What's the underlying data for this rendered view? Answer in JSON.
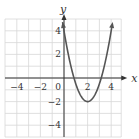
{
  "chart_data": {
    "type": "line",
    "title": "",
    "xlabel": "x",
    "ylabel": "y",
    "xlim": [
      -5,
      4.8
    ],
    "ylim": [
      -5,
      5
    ],
    "grid": true,
    "x_ticks": [
      -4,
      -2,
      0,
      2,
      4
    ],
    "y_ticks": [
      4,
      2,
      -2,
      -4
    ],
    "x_tick_labels": [
      "−4",
      "−2",
      "0",
      "2",
      "4"
    ],
    "y_tick_labels": [
      "4",
      "2",
      "−2",
      "−4"
    ],
    "series": [
      {
        "name": "parabola",
        "equation": "y = 1.5(x - 2)^2 - 2",
        "vertex": [
          2,
          -2
        ],
        "y_intercept": [
          0,
          4
        ],
        "x_intercepts": [
          0.85,
          3.15
        ],
        "x": [
          -0.1,
          0,
          0.5,
          1,
          1.5,
          2,
          2.5,
          3,
          3.5,
          4,
          4.3
        ],
        "y": [
          4.6,
          4,
          1.4,
          -0.5,
          -1.6,
          -2,
          -1.6,
          -0.5,
          1.4,
          4,
          5.9
        ],
        "arrows_at_ends": true
      }
    ],
    "colors": {
      "curve": "#555555",
      "grid": "#d8d8d8",
      "axis": "#333333"
    }
  }
}
